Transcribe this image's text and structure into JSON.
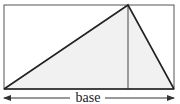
{
  "diagram": {
    "base_label": "base",
    "colors": {
      "stroke": "#333333",
      "fill": "#f1f1f1",
      "background": "#ffffff"
    },
    "rectangle": {
      "x1": 4,
      "y1": 5,
      "x2": 174,
      "y2": 89
    },
    "triangle": {
      "vertices": [
        [
          4,
          89
        ],
        [
          128,
          5
        ],
        [
          174,
          89
        ]
      ]
    },
    "height_line": {
      "x": 128,
      "y1": 5,
      "y2": 89
    },
    "base_arrow": {
      "x1": 4,
      "x2": 174,
      "y": 98
    }
  }
}
